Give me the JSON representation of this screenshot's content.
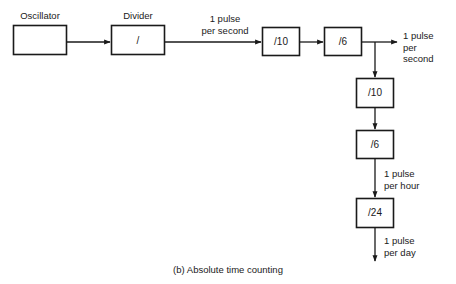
{
  "figure": {
    "caption": "(b) Absolute time counting",
    "stroke_color": "#1a1a1a",
    "text_color": "#1a1a1a",
    "background_color": "#ffffff"
  },
  "blocks": [
    {
      "id": "oscillator",
      "label_above": "Oscillator",
      "inner_text": ""
    },
    {
      "id": "divider",
      "label_above": "Divider",
      "inner_text": "/"
    },
    {
      "id": "div10-a",
      "label_above": "",
      "inner_text": "/10"
    },
    {
      "id": "div6-a",
      "label_above": "",
      "inner_text": "/6"
    },
    {
      "id": "div10-b",
      "label_above": "",
      "inner_text": "/10"
    },
    {
      "id": "div6-b",
      "label_above": "",
      "inner_text": "/6"
    },
    {
      "id": "div24",
      "label_above": "",
      "inner_text": "/24"
    }
  ],
  "annotations": {
    "pulse_per_second_in": "1 pulse\nper second",
    "pulse_per_second_out": "1 pulse\nper\nsecond",
    "pulse_per_hour": "1 pulse\nper hour",
    "pulse_per_day": "1 pulse\nper day"
  }
}
